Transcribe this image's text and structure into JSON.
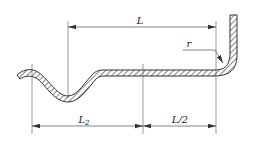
{
  "diagram": {
    "title": "",
    "labels": {
      "overall_length": "L",
      "segment_left": "L",
      "segment_left_subscript": "2",
      "segment_right": "L/2",
      "bend_radius": "r"
    },
    "colors": {
      "line": "#333333",
      "hatch": "#444444",
      "background": "#ffffff"
    }
  }
}
